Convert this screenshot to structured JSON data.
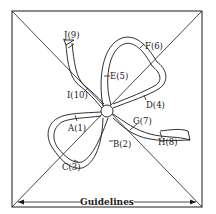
{
  "diagram": {
    "guidelines_label": "Guidelines",
    "points": [
      {
        "id": "A",
        "step": 1,
        "label": "A(1)"
      },
      {
        "id": "B",
        "step": 2,
        "label": "B(2)"
      },
      {
        "id": "C",
        "step": 3,
        "label": "C(3)"
      },
      {
        "id": "D",
        "step": 4,
        "label": "D(4)"
      },
      {
        "id": "E",
        "step": 5,
        "label": "E(5)"
      },
      {
        "id": "F",
        "step": 6,
        "label": "F(6)"
      },
      {
        "id": "G",
        "step": 7,
        "label": "G(7)"
      },
      {
        "id": "H",
        "step": 8,
        "label": "H(8)"
      },
      {
        "id": "I",
        "step": 9,
        "label": "I(10)"
      },
      {
        "id": "J",
        "step": 10,
        "label": "J(9)"
      }
    ],
    "colors": {
      "line": "#1a1a1a",
      "background": "#ffffff"
    }
  }
}
